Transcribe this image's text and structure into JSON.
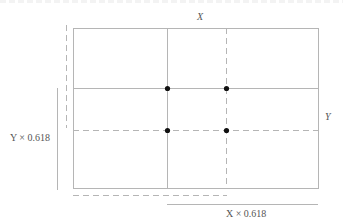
{
  "diagram": {
    "labels": {
      "width": "X",
      "height": "Y",
      "height_ratio": "Y × 0.618",
      "width_ratio": "X × 0.618"
    },
    "rectangle": {
      "x": 73,
      "y": 28,
      "width": 245,
      "height": 160
    },
    "lines": {
      "solid_vertical_x": 167,
      "dashed_vertical_x": 226,
      "solid_horizontal_y": 88,
      "dashed_horizontal_y": 130
    },
    "intersection_points": [
      {
        "x": 167,
        "y": 88
      },
      {
        "x": 226,
        "y": 88
      },
      {
        "x": 167,
        "y": 130
      },
      {
        "x": 226,
        "y": 130
      }
    ],
    "colors": {
      "line": "#b5b5b5",
      "dot": "#111111",
      "text": "#555555"
    }
  }
}
